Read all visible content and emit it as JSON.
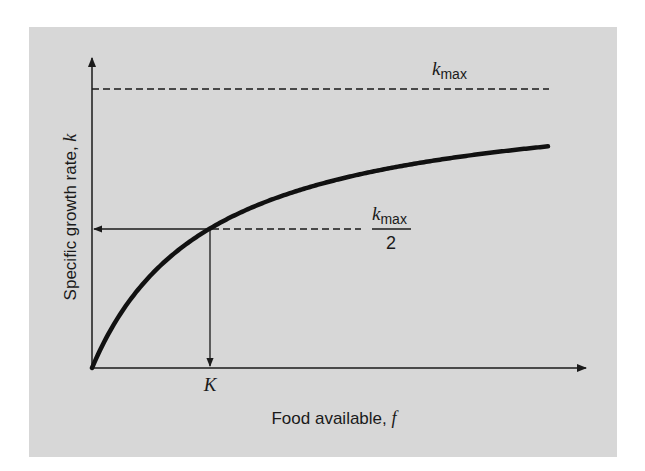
{
  "figure": {
    "type": "monod-saturation-curve",
    "background_color": "#d7d7d7",
    "curve_color": "#111111",
    "axis_color": "#1a1a1a"
  },
  "labels": {
    "y_axis": "Specific growth rate, ",
    "y_axis_var": "k",
    "x_axis": "Food available, ",
    "x_axis_var": "f",
    "k_label": "K",
    "kmax_k": "k",
    "kmax_sub": "max",
    "half_k": "k",
    "half_sub": "max",
    "half_denominator": "2"
  },
  "chart_data": {
    "type": "line",
    "title": "",
    "xlabel": "Food available, f",
    "ylabel": "Specific growth rate, k",
    "equation": "k = kmax * f / (K + f)",
    "reference_lines": [
      {
        "label": "kmax",
        "orientation": "horizontal",
        "style": "dashed",
        "value": "kmax"
      },
      {
        "label": "kmax/2",
        "orientation": "horizontal",
        "style": "dashed",
        "value": "kmax/2"
      },
      {
        "label": "K",
        "orientation": "vertical",
        "style": "solid-arrow",
        "value": "K"
      }
    ],
    "series": [
      {
        "name": "k(f)",
        "x_relative_to_K": [
          0,
          0.25,
          0.5,
          1,
          1.5,
          2,
          3,
          3.86
        ],
        "y_relative_to_kmax": [
          0,
          0.2,
          0.333,
          0.5,
          0.6,
          0.667,
          0.75,
          0.794
        ]
      }
    ],
    "ticks": {
      "x": [
        "K"
      ],
      "y": []
    },
    "grid": false,
    "legend": null
  }
}
